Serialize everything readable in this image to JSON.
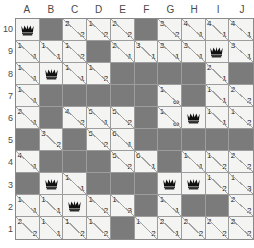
{
  "board": {
    "title": "queens-number-grid",
    "columns": [
      "A",
      "B",
      "C",
      "D",
      "E",
      "F",
      "G",
      "H",
      "I",
      "J"
    ],
    "rows": [
      "10",
      "9",
      "8",
      "7",
      "6",
      "5",
      "4",
      "3",
      "2",
      "1"
    ],
    "colors": {
      "light_cell": "#f4f4f2",
      "dark_cell": "#7b7b7b",
      "grid_line": "#9d9d9d",
      "text": "#1c1c1c",
      "header_text": "#4a4a4a"
    },
    "glyphs": {
      "queen": "queen-icon",
      "infinity": "∞"
    },
    "cells": [
      [
        {
          "t": "queen"
        },
        {
          "t": "dark"
        },
        {
          "t": "split",
          "tl": "2",
          "br": "2"
        },
        {
          "t": "split",
          "tl": "1",
          "br": "2"
        },
        {
          "t": "split",
          "tl": "2",
          "br": "2"
        },
        {
          "t": "dark"
        },
        {
          "t": "split",
          "tl": "3",
          "br": "2"
        },
        {
          "t": "split",
          "tl": "4",
          "br": "1"
        },
        {
          "t": "split",
          "tl": "4",
          "br": "1"
        },
        {
          "t": "split",
          "tl": "4",
          "br": "1"
        }
      ],
      [
        {
          "t": "split",
          "tl": "1",
          "br": "1"
        },
        {
          "t": "split",
          "tl": "1",
          "br": "1"
        },
        {
          "t": "split",
          "tl": "1",
          "br": "2"
        },
        {
          "t": "dark"
        },
        {
          "t": "split",
          "tl": "2",
          "br": "1"
        },
        {
          "t": "split",
          "tl": "3",
          "br": "1"
        },
        {
          "t": "split",
          "tl": "3",
          "br": "1"
        },
        {
          "t": "split",
          "tl": "3",
          "br": "1"
        },
        {
          "t": "queen"
        },
        {
          "t": "split",
          "tl": "3",
          "br": "1"
        }
      ],
      [
        {
          "t": "split",
          "tl": "1",
          "br": "1"
        },
        {
          "t": "queen"
        },
        {
          "t": "split",
          "tl": "1",
          "br": "1"
        },
        {
          "t": "split",
          "tl": "1",
          "br": "2"
        },
        {
          "t": "dark"
        },
        {
          "t": "dark"
        },
        {
          "t": "dark"
        },
        {
          "t": "dark"
        },
        {
          "t": "split",
          "tl": "2",
          "br": "1"
        },
        {
          "t": "dark"
        }
      ],
      [
        {
          "t": "split",
          "tl": "1",
          "br": "1"
        },
        {
          "t": "dark"
        },
        {
          "t": "dark"
        },
        {
          "t": "dark"
        },
        {
          "t": "dark"
        },
        {
          "t": "dark"
        },
        {
          "t": "split",
          "tl": "1",
          "br": "∞"
        },
        {
          "t": "dark"
        },
        {
          "t": "split",
          "tl": "1",
          "br": "1"
        },
        {
          "t": "split",
          "tl": "2",
          "br": "2"
        }
      ],
      [
        {
          "t": "split",
          "tl": "2",
          "br": "1"
        },
        {
          "t": "dark"
        },
        {
          "t": "split",
          "tl": "4",
          "br": "2"
        },
        {
          "t": "split",
          "tl": "5",
          "br": "1"
        },
        {
          "t": "split",
          "tl": "5",
          "br": "2"
        },
        {
          "t": "dark"
        },
        {
          "t": "split",
          "tl": "1",
          "br": "∞"
        },
        {
          "t": "queen"
        },
        {
          "t": "split",
          "tl": "1",
          "br": "1"
        },
        {
          "t": "split",
          "tl": "1",
          "br": "2"
        }
      ],
      [
        {
          "t": "dark"
        },
        {
          "t": "split",
          "tl": "3",
          "br": "2"
        },
        {
          "t": "dark"
        },
        {
          "t": "split",
          "tl": "5",
          "br": "2"
        },
        {
          "t": "split",
          "tl": "6",
          "br": "1"
        },
        {
          "t": "dark"
        },
        {
          "t": "dark"
        },
        {
          "t": "dark"
        },
        {
          "t": "dark"
        },
        {
          "t": "dark"
        }
      ],
      [
        {
          "t": "split",
          "tl": "4",
          "br": "1"
        },
        {
          "t": "dark"
        },
        {
          "t": "dark"
        },
        {
          "t": "dark"
        },
        {
          "t": "split",
          "tl": "5",
          "br": "2"
        },
        {
          "t": "split",
          "tl": "6",
          "br": "1"
        },
        {
          "t": "dark"
        },
        {
          "t": "split",
          "tl": "1",
          "br": "1"
        },
        {
          "t": "split",
          "tl": "1",
          "br": "2"
        },
        {
          "t": "split",
          "tl": "2",
          "br": "2"
        }
      ],
      [
        {
          "t": "dark"
        },
        {
          "t": "queen"
        },
        {
          "t": "split",
          "tl": "1",
          "br": "1"
        },
        {
          "t": "dark"
        },
        {
          "t": "dark"
        },
        {
          "t": "dark"
        },
        {
          "t": "queen"
        },
        {
          "t": "queen"
        },
        {
          "t": "split",
          "tl": "1",
          "br": "2"
        },
        {
          "t": "split",
          "tl": "1",
          "br": "3"
        }
      ],
      [
        {
          "t": "split",
          "tl": "1",
          "br": "1"
        },
        {
          "t": "split",
          "tl": "1",
          "br": "1"
        },
        {
          "t": "queen"
        },
        {
          "t": "split",
          "tl": "1",
          "br": "2"
        },
        {
          "t": "split",
          "tl": "1",
          "br": "3"
        },
        {
          "t": "dark"
        },
        {
          "t": "split",
          "tl": "1",
          "br": "1"
        },
        {
          "t": "dark"
        },
        {
          "t": "dark"
        },
        {
          "t": "split",
          "tl": "2",
          "br": "2"
        }
      ],
      [
        {
          "t": "split",
          "tl": "2",
          "br": "2"
        },
        {
          "t": "split",
          "tl": "1",
          "br": "1"
        },
        {
          "t": "split",
          "tl": "1",
          "br": "2"
        },
        {
          "t": "split",
          "tl": "1",
          "br": "2"
        },
        {
          "t": "dark"
        },
        {
          "t": "split",
          "tl": "1",
          "br": "2"
        },
        {
          "t": "split",
          "tl": "2",
          "br": "1"
        },
        {
          "t": "split",
          "tl": "2",
          "br": "2"
        },
        {
          "t": "split",
          "tl": "2",
          "br": "2"
        },
        {
          "t": "split",
          "tl": "2",
          "br": "2"
        }
      ]
    ]
  }
}
